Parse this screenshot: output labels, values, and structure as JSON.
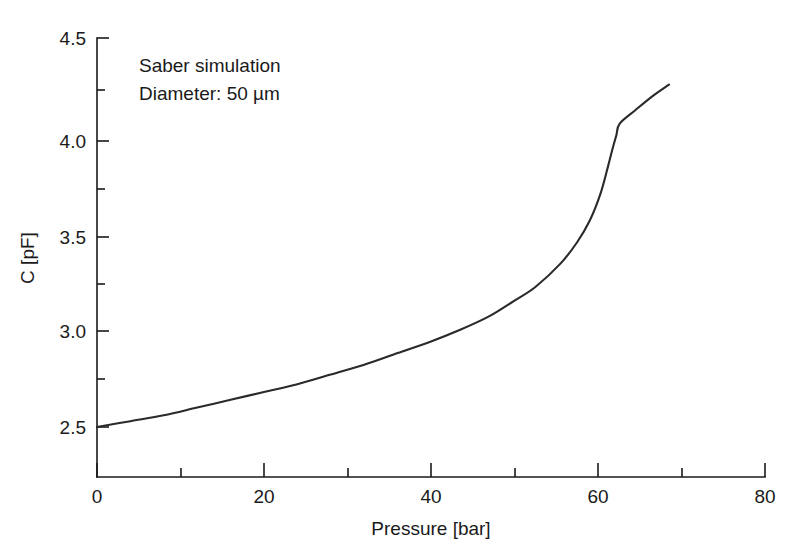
{
  "chart_data": {
    "type": "line",
    "title": "",
    "subtitle": "",
    "xlabel": "Pressure [bar]",
    "ylabel": "C [pF]",
    "xlim": [
      0,
      80
    ],
    "ylim": [
      2.24,
      4.5
    ],
    "grid": false,
    "legend": null,
    "x_ticks_major": [
      0,
      20,
      40,
      60,
      80
    ],
    "x_tick_labels": [
      "0",
      "20",
      "40",
      "60",
      "80"
    ],
    "x_ticks_minor": [
      10,
      30,
      50,
      70
    ],
    "y_ticks_major": [
      2.5,
      3.0,
      3.5,
      4.0,
      4.5
    ],
    "y_tick_labels": [
      "2.5",
      "3.0",
      "3.5",
      "4.0",
      "4.5"
    ],
    "y_ticks_minor": [
      2.75,
      3.25,
      3.75,
      4.25
    ],
    "annotations": [
      "Saber simulation",
      "Diameter: 50 µm"
    ],
    "series": [
      {
        "name": "Saber simulation",
        "color": "#2a2a2a",
        "x": [
          0,
          4,
          8,
          12,
          16,
          20,
          24,
          28,
          32,
          36,
          40,
          43.5,
          47,
          50,
          52.5,
          55.5,
          57.5,
          59,
          60.3,
          61.2,
          61.8,
          62.2,
          62.6,
          64.5,
          66.5,
          68.5
        ],
        "y": [
          2.5,
          2.53,
          2.56,
          2.6,
          2.64,
          2.68,
          2.72,
          2.77,
          2.82,
          2.88,
          2.94,
          3.0,
          3.07,
          3.15,
          3.22,
          3.34,
          3.45,
          3.56,
          3.7,
          3.84,
          3.94,
          4.0,
          4.06,
          4.13,
          4.2,
          4.26
        ]
      }
    ]
  },
  "axes": {
    "x_axis_name": "pressure-axis",
    "y_axis_name": "capacitance-axis"
  }
}
